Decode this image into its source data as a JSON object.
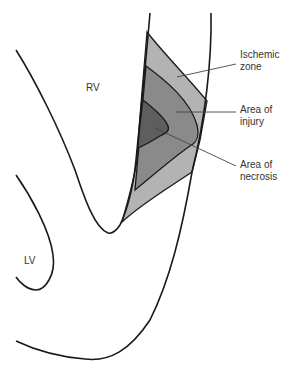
{
  "figure": {
    "type": "anatomical-diagram"
  },
  "chambers": {
    "rv": {
      "label": "RV",
      "x": 86,
      "y": 82
    },
    "lv": {
      "label": "LV",
      "x": 24,
      "y": 255
    }
  },
  "zones": [
    {
      "id": "ischemic",
      "label": "Ischemic\nzone",
      "color": "#b3b3b3",
      "label_x": 240,
      "label_y": 46
    },
    {
      "id": "injury",
      "label": "Area of\ninjury",
      "color": "#8a8a8a",
      "label_x": 240,
      "label_y": 102
    },
    {
      "id": "necrosis",
      "label": "Area of\nnecrosis",
      "color": "#5e5e5e",
      "label_x": 240,
      "label_y": 158
    }
  ],
  "colors": {
    "outline": "#1a1a1a",
    "leader": "#444444",
    "background": "#ffffff"
  }
}
